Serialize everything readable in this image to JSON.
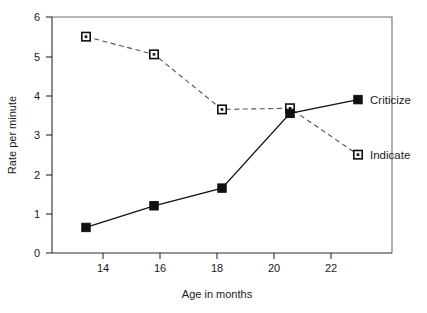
{
  "chart_data": {
    "type": "line",
    "title": "",
    "xlabel": "Age in months",
    "ylabel": "Rate per minute",
    "x": [
      14,
      16,
      18,
      20,
      22
    ],
    "xtick_labels": [
      "14",
      "16",
      "18",
      "20",
      "22"
    ],
    "ytick_labels": [
      "0",
      "1",
      "2",
      "3",
      "4",
      "5",
      "6"
    ],
    "xlim": [
      13,
      23
    ],
    "ylim": [
      0,
      6
    ],
    "grid": false,
    "legend_position": "inline-right-end-of-series",
    "series": [
      {
        "name": "Criticize",
        "marker": "filled-square",
        "linestyle": "solid",
        "color": "#111111",
        "values": [
          0.65,
          1.2,
          1.65,
          3.55,
          3.9
        ]
      },
      {
        "name": "Indicate",
        "marker": "open-square",
        "linestyle": "dashed",
        "color": "#555555",
        "values": [
          5.5,
          5.05,
          3.65,
          3.68,
          2.5
        ]
      }
    ]
  },
  "labels": {
    "criticize": "Criticize",
    "indicate": "Indicate",
    "xlabel": "Age in months",
    "ylabel": "Rate per minute"
  },
  "ticks": {
    "y0": "0",
    "y1": "1",
    "y2": "2",
    "y3": "3",
    "y4": "4",
    "y5": "5",
    "y6": "6",
    "x14": "14",
    "x16": "16",
    "x18": "18",
    "x20": "20",
    "x22": "22"
  }
}
